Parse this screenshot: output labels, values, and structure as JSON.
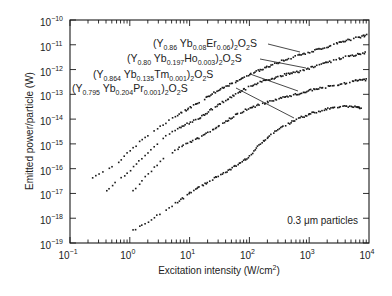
{
  "chart_data": {
    "type": "scatter",
    "title": "",
    "xlabel": "Excitation intensity (W/cm²)",
    "ylabel": "Emitted power/particle (W)",
    "xscale": "log",
    "yscale": "log",
    "xlim": [
      0.1,
      10000
    ],
    "ylim": [
      1e-19,
      1e-10
    ],
    "x_tick_labels": [
      {
        "base": "10",
        "exp": "−1"
      },
      {
        "base": "10",
        "exp": "0"
      },
      {
        "base": "10",
        "exp": "1"
      },
      {
        "base": "10",
        "exp": "2"
      },
      {
        "base": "10",
        "exp": "3"
      },
      {
        "base": "10",
        "exp": "4"
      }
    ],
    "y_tick_labels": [
      {
        "base": "10",
        "exp": "−10"
      },
      {
        "base": "10",
        "exp": "−11"
      },
      {
        "base": "10",
        "exp": "−12"
      },
      {
        "base": "10",
        "exp": "−13"
      },
      {
        "base": "10",
        "exp": "−14"
      },
      {
        "base": "10",
        "exp": "−15"
      },
      {
        "base": "10",
        "exp": "−16"
      },
      {
        "base": "10",
        "exp": "−17"
      },
      {
        "base": "10",
        "exp": "−18"
      },
      {
        "base": "10",
        "exp": "−19"
      }
    ],
    "grid": false,
    "legend": "inline labels with leader lines",
    "annotation": "0.3 μm particles",
    "series": [
      {
        "name": "(Y0.86 Yb0.08 Er0.06)2O2S",
        "label_parts": [
          [
            "(Y",
            ""
          ],
          [
            "0.86",
            "sub"
          ],
          [
            " Yb",
            ""
          ],
          [
            "0.08",
            "sub"
          ],
          [
            "Er",
            ""
          ],
          [
            "0.06",
            "sub"
          ],
          [
            ")",
            ""
          ],
          [
            "2",
            "sub"
          ],
          [
            "O",
            ""
          ],
          [
            "2",
            "sub"
          ],
          [
            "S",
            ""
          ]
        ],
        "label_pos": [
          153,
          47
        ],
        "leader": [
          [
            268,
            44
          ],
          [
            300,
            52
          ]
        ],
        "log_x": [
          -0.63,
          -0.4,
          -0.2,
          0.0,
          0.2,
          0.4,
          0.6,
          0.8,
          1.0,
          1.2,
          1.4,
          1.6,
          1.8,
          2.0,
          2.2,
          2.4,
          2.6,
          2.8,
          3.0,
          3.2,
          3.4,
          3.6,
          3.8,
          3.97
        ],
        "log_y": [
          -16.35,
          -16.1,
          -15.75,
          -15.3,
          -14.85,
          -14.5,
          -14.15,
          -13.85,
          -13.55,
          -13.25,
          -12.95,
          -12.7,
          -12.45,
          -12.2,
          -12.0,
          -11.8,
          -11.6,
          -11.45,
          -11.3,
          -11.15,
          -11.0,
          -10.85,
          -10.72,
          -10.6
        ]
      },
      {
        "name": "(Y0.80 Yb0.197 Ho0.003)2O2S",
        "label_parts": [
          [
            "(Y",
            ""
          ],
          [
            "0.80",
            "sub"
          ],
          [
            " Yb",
            ""
          ],
          [
            "0.197",
            "sub"
          ],
          [
            "Ho",
            ""
          ],
          [
            "0.003",
            "sub"
          ],
          [
            ")",
            ""
          ],
          [
            "2",
            "sub"
          ],
          [
            "O",
            ""
          ],
          [
            "2",
            "sub"
          ],
          [
            "S",
            ""
          ]
        ],
        "label_pos": [
          127,
          62
        ],
        "leader": [
          [
            260,
            59
          ],
          [
            306,
            68
          ]
        ],
        "log_x": [
          -0.4,
          -0.2,
          0.0,
          0.2,
          0.4,
          0.6,
          0.8,
          1.0,
          1.2,
          1.4,
          1.6,
          1.8,
          2.0,
          2.2,
          2.4,
          2.6,
          2.8,
          3.0,
          3.2,
          3.4,
          3.6,
          3.8,
          3.97
        ],
        "log_y": [
          -16.9,
          -16.5,
          -16.1,
          -15.6,
          -15.1,
          -14.7,
          -14.4,
          -14.15,
          -13.9,
          -13.55,
          -13.25,
          -12.95,
          -12.7,
          -12.5,
          -12.35,
          -12.2,
          -12.1,
          -11.95,
          -11.8,
          -11.65,
          -11.5,
          -11.4,
          -11.3
        ]
      },
      {
        "name": "(Y0.864 Yb0.135 Tm0.001)2O2S",
        "label_parts": [
          [
            "(Y",
            ""
          ],
          [
            "0.864",
            "sub"
          ],
          [
            " Yb",
            ""
          ],
          [
            "0.135",
            "sub"
          ],
          [
            "Tm",
            ""
          ],
          [
            "0.001",
            "sub"
          ],
          [
            ")",
            ""
          ],
          [
            "2",
            "sub"
          ],
          [
            "O",
            ""
          ],
          [
            "2",
            "sub"
          ],
          [
            "S",
            ""
          ]
        ],
        "label_pos": [
          93,
          78
        ],
        "leader": [
          [
            250,
            74
          ],
          [
            298,
            91
          ]
        ],
        "log_x": [
          0.05,
          0.2,
          0.4,
          0.6,
          0.8,
          1.0,
          1.2,
          1.4,
          1.6,
          1.8,
          2.0,
          2.2,
          2.4,
          2.6,
          2.8,
          3.0,
          3.2,
          3.4,
          3.6,
          3.8,
          3.97
        ],
        "log_y": [
          -16.9,
          -16.5,
          -16.0,
          -15.5,
          -15.2,
          -14.95,
          -14.7,
          -14.4,
          -14.1,
          -13.8,
          -13.55,
          -13.4,
          -13.25,
          -13.1,
          -13.0,
          -12.85,
          -12.75,
          -12.65,
          -12.55,
          -12.45,
          -12.4
        ]
      },
      {
        "name": "(Y0.795 Yb0.204 Pr0.001)2O2S",
        "label_parts": [
          [
            "(Y",
            ""
          ],
          [
            "0.795",
            "sub"
          ],
          [
            " Yb",
            ""
          ],
          [
            "0.204",
            "sub"
          ],
          [
            "Pr",
            ""
          ],
          [
            "0.001",
            "sub"
          ],
          [
            ")",
            ""
          ],
          [
            "2",
            "sub"
          ],
          [
            "O",
            ""
          ],
          [
            "2",
            "sub"
          ],
          [
            "S",
            ""
          ]
        ],
        "label_pos": [
          72,
          92
        ],
        "leader": [
          [
            236,
            88
          ],
          [
            294,
            118
          ]
        ],
        "log_x": [
          0.05,
          0.2,
          0.4,
          0.6,
          0.8,
          1.0,
          1.2,
          1.4,
          1.6,
          1.8,
          2.0,
          2.2,
          2.4,
          2.6,
          2.8,
          3.0,
          3.2,
          3.4,
          3.6,
          3.8,
          3.88
        ],
        "log_y": [
          -18.5,
          -18.3,
          -18.0,
          -17.65,
          -17.35,
          -17.0,
          -16.7,
          -16.4,
          -16.15,
          -15.85,
          -15.5,
          -14.95,
          -14.55,
          -14.25,
          -14.0,
          -13.8,
          -13.65,
          -13.55,
          -13.5,
          -13.5,
          -13.6
        ]
      }
    ]
  },
  "plot_area": {
    "left": 70,
    "top": 20,
    "right": 369,
    "bottom": 243
  },
  "colors": {
    "ink": "#1a1a1a",
    "background": "#ffffff"
  }
}
